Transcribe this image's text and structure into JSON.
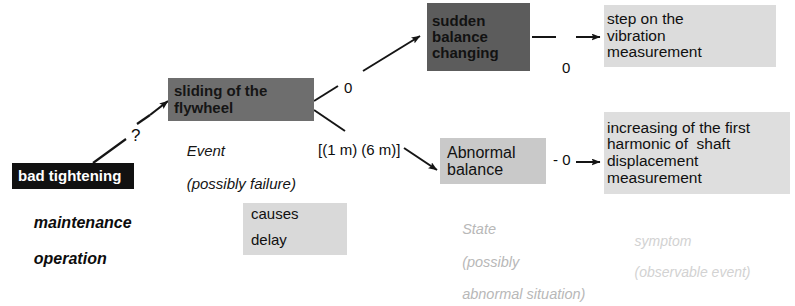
{
  "diagram": {
    "nodes": {
      "bad_tightening": {
        "label": "bad tightening",
        "caption_lines": [
          "maintenance",
          "operation"
        ],
        "fill": "#111111",
        "text_color": "#ffffff",
        "kind": "cause"
      },
      "sliding_flywheel": {
        "lines": [
          "sliding of the",
          "flywheel"
        ],
        "caption_lines": [
          "Event",
          "(possibly failure)"
        ],
        "fill": "#6e6e6e",
        "text_color": "#151515",
        "kind": "event"
      },
      "sudden_balance_changing": {
        "lines": [
          "sudden",
          "balance",
          "changing"
        ],
        "fill": "#5c5c5c",
        "text_color": "#121212",
        "kind": "event"
      },
      "abnormal_balance": {
        "lines": [
          "Abnormal",
          "balance"
        ],
        "caption_lines": [
          "State",
          "(possibly",
          "abnormal situation)"
        ],
        "fill": "#c9c9c9",
        "text_color": "#111111",
        "kind": "state"
      },
      "symptom_vibration": {
        "lines": [
          "step on the",
          "vibration",
          "measurement"
        ],
        "fill": "#dcdcdc",
        "text_color": "#101010",
        "kind": "symptom"
      },
      "symptom_harmonic": {
        "lines": [
          "increasing of the first",
          "harmonic of  shaft",
          "displacement",
          "measurement"
        ],
        "caption_lines": [
          "symptom",
          "(observable event)"
        ],
        "fill": "#dedede",
        "text_color": "#101010",
        "kind": "symptom"
      }
    },
    "edge_labels": {
      "question": "?",
      "zero_to_sudden": "0",
      "delay_spec": "[(1 m) (6 m)]",
      "zero_to_vibration": "0",
      "zero_to_harmonic": "- 0"
    },
    "legend": {
      "numerator": "causes",
      "denominator": "delay"
    }
  }
}
